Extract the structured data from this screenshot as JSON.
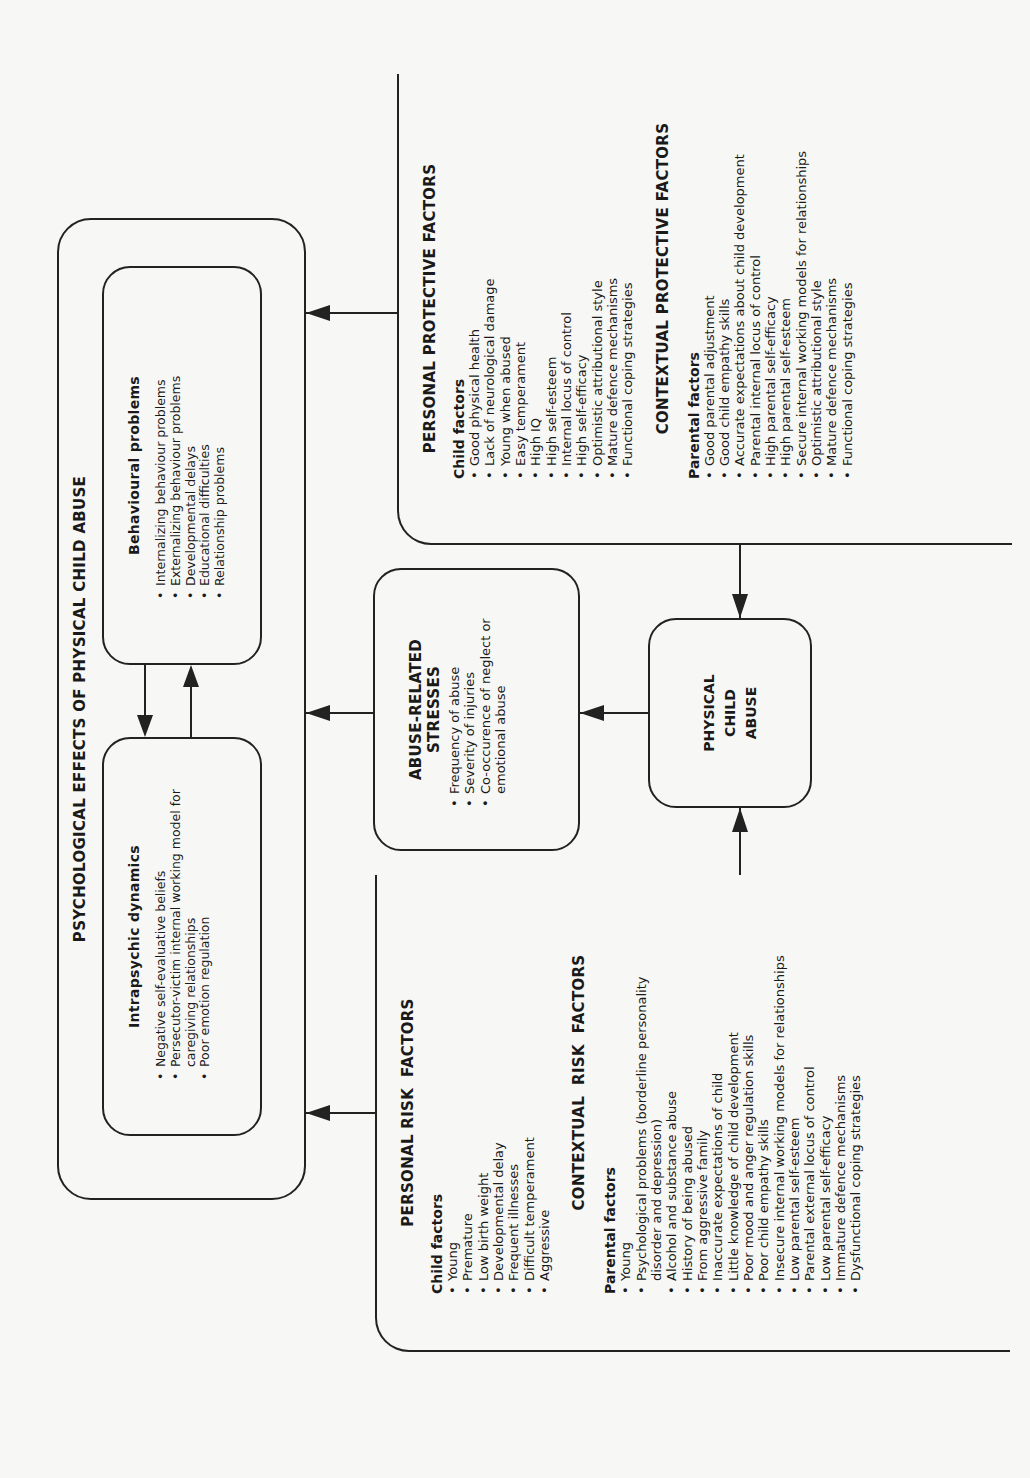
{
  "diagram": {
    "title": "PSYCHOLOGICAL EFFECTS OF PHYSICAL CHILD ABUSE",
    "behavioural": {
      "title": "Behavioural problems",
      "items": [
        "Internalizing behaviour problems",
        "Externalizing behaviour problems",
        "Developmental delays",
        "Educational difficulties",
        "Relationship problems"
      ]
    },
    "intrapsychic": {
      "title": "Intrapsychic dynamics",
      "items": [
        "Negative self-evaluative beliefs",
        "Persecutor-victim internal working model for caregiving relationships",
        "Poor emotion regulation"
      ]
    },
    "stresses": {
      "title": "ABUSE-RELATED STRESSES",
      "items": [
        "Frequency of abuse",
        "Severity of injuries",
        "Co-occurence of neglect or emotional abuse"
      ]
    },
    "abuse": {
      "line1": "PHYSICAL",
      "line2": "CHILD",
      "line3": "ABUSE"
    },
    "protective": {
      "personal_title": "PERSONAL PROTECTIVE FACTORS",
      "child_label": "Child factors",
      "child_items": [
        "Good physical health",
        "Lack of neurological damage",
        "Young when abused",
        "Easy temperament",
        "High IQ",
        "High self-esteem",
        "Internal locus of control",
        "High self-efficacy",
        "Optimistic attributional style",
        "Mature defence mechanisms",
        "Functional coping strategies"
      ],
      "contextual_title": "CONTEXTUAL PROTECTIVE FACTORS",
      "parent_label": "Parental factors",
      "parent_items": [
        "Good parental adjustment",
        "Good child empathy skills",
        "Accurate expectations about child development",
        "Parental internal locus of control",
        "High parental self-efficacy",
        "High parental self-esteem",
        "Secure internal working models for relationships",
        "Optimistic attributional style",
        "Mature defence mechanisms",
        "Functional coping strategies"
      ]
    },
    "risk": {
      "personal_title": "PERSONAL RISK  FACTORS",
      "child_label": "Child factors",
      "child_items": [
        "Young",
        "Premature",
        "Low birth weight",
        "Developmental delay",
        "Frequent illnesses",
        "Difficult temperament",
        "Aggressive"
      ],
      "contextual_title": "CONTEXTUAL  RISK  FACTORS",
      "parent_label": "Parental factors",
      "parent_items": [
        "Young",
        "Psychological problems (borderline personality disorder and depression)",
        "Alcohol and substance abuse",
        "History of being abused",
        "From aggressive family",
        "Inaccurate expectations of child",
        "Little knowledge of child development",
        "Poor mood and anger regulation skills",
        "Poor child empathy skills",
        "Insecure internal working models for relationships",
        "Low parental self-esteem",
        "Parental external locus of control",
        "Low parental self-efficacy",
        "Immature defence mechanisms",
        "Dysfunctional coping strategies"
      ]
    }
  }
}
